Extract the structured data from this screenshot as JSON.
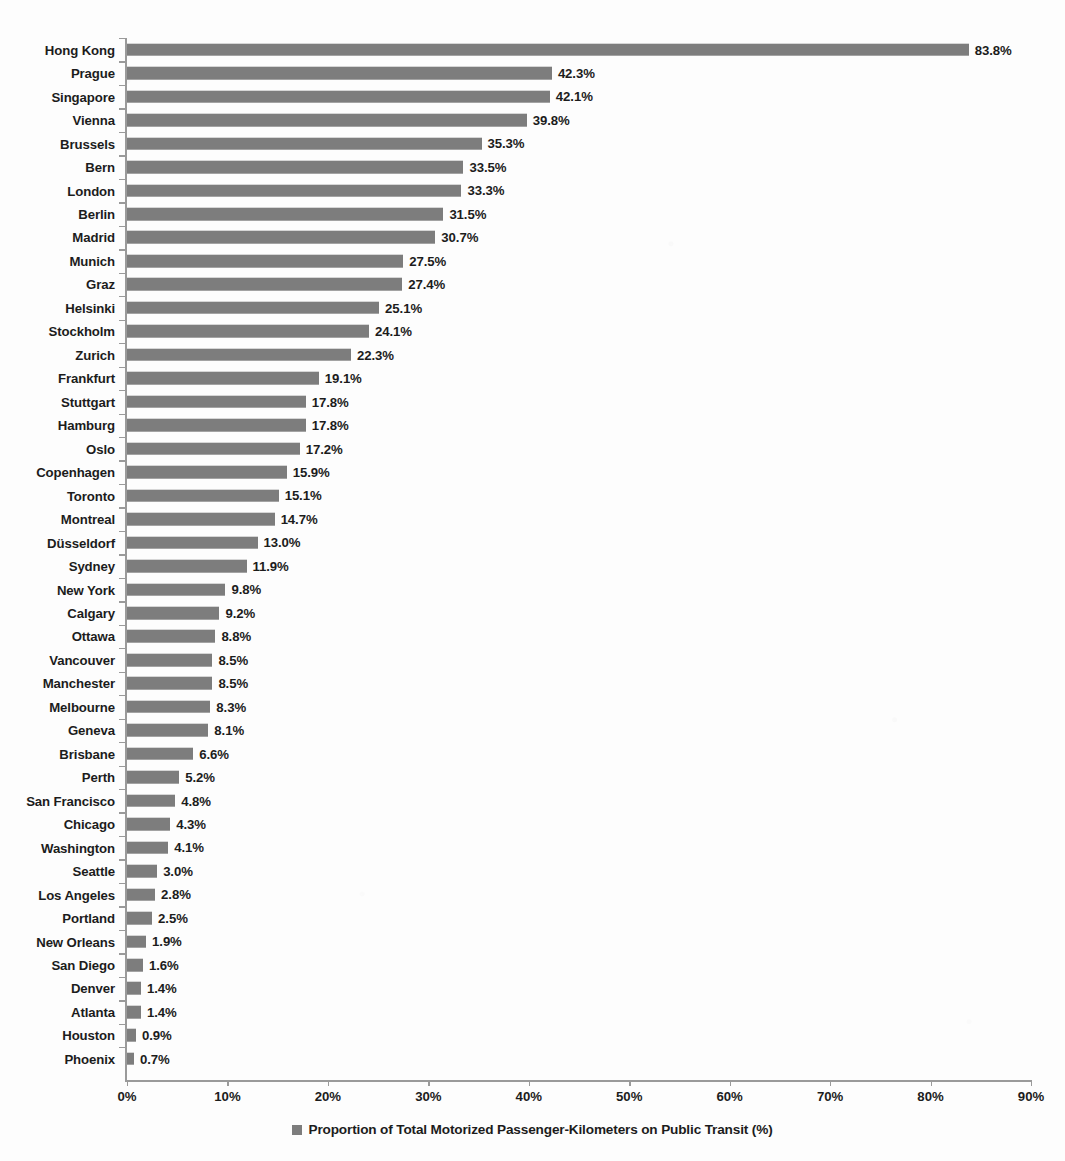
{
  "chart_data": {
    "type": "bar",
    "orientation": "horizontal",
    "title": "",
    "xlabel": "",
    "ylabel": "",
    "xlim": [
      0,
      90
    ],
    "grid": false,
    "legend_position": "bottom",
    "legend": [
      "Proportion of Total Motorized Passenger-Kilometers on Public Transit (%)"
    ],
    "xticks": [
      "0%",
      "10%",
      "20%",
      "30%",
      "40%",
      "50%",
      "60%",
      "70%",
      "80%",
      "90%"
    ],
    "xtick_values": [
      0,
      10,
      20,
      30,
      40,
      50,
      60,
      70,
      80,
      90
    ],
    "series_name": "Proportion of Total Motorized Passenger-Kilometers on Public Transit (%)",
    "bar_color": "#7d7d7d",
    "categories": [
      "Hong Kong",
      "Prague",
      "Singapore",
      "Vienna",
      "Brussels",
      "Bern",
      "London",
      "Berlin",
      "Madrid",
      "Munich",
      "Graz",
      "Helsinki",
      "Stockholm",
      "Zurich",
      "Frankfurt",
      "Stuttgart",
      "Hamburg",
      "Oslo",
      "Copenhagen",
      "Toronto",
      "Montreal",
      "Düsseldorf",
      "Sydney",
      "New York",
      "Calgary",
      "Ottawa",
      "Vancouver",
      "Manchester",
      "Melbourne",
      "Geneva",
      "Brisbane",
      "Perth",
      "San Francisco",
      "Chicago",
      "Washington",
      "Seattle",
      "Los Angeles",
      "Portland",
      "New Orleans",
      "San Diego",
      "Denver",
      "Atlanta",
      "Houston",
      "Phoenix"
    ],
    "values": [
      83.8,
      42.3,
      42.1,
      39.8,
      35.3,
      33.5,
      33.3,
      31.5,
      30.7,
      27.5,
      27.4,
      25.1,
      24.1,
      22.3,
      19.1,
      17.8,
      17.8,
      17.2,
      15.9,
      15.1,
      14.7,
      13.0,
      11.9,
      9.8,
      9.2,
      8.8,
      8.5,
      8.5,
      8.3,
      8.1,
      6.6,
      5.2,
      4.8,
      4.3,
      4.1,
      3.0,
      2.8,
      2.5,
      1.9,
      1.6,
      1.4,
      1.4,
      0.9,
      0.7
    ],
    "value_labels": [
      "83.8%",
      "42.3%",
      "42.1%",
      "39.8%",
      "35.3%",
      "33.5%",
      "33.3%",
      "31.5%",
      "30.7%",
      "27.5%",
      "27.4%",
      "25.1%",
      "24.1%",
      "22.3%",
      "19.1%",
      "17.8%",
      "17.8%",
      "17.2%",
      "15.9%",
      "15.1%",
      "14.7%",
      "13.0%",
      "11.9%",
      "9.8%",
      "9.2%",
      "8.8%",
      "8.5%",
      "8.5%",
      "8.3%",
      "8.1%",
      "6.6%",
      "5.2%",
      "4.8%",
      "4.3%",
      "4.1%",
      "3.0%",
      "2.8%",
      "2.5%",
      "1.9%",
      "1.6%",
      "1.4%",
      "1.4%",
      "0.9%",
      "0.7%"
    ]
  }
}
